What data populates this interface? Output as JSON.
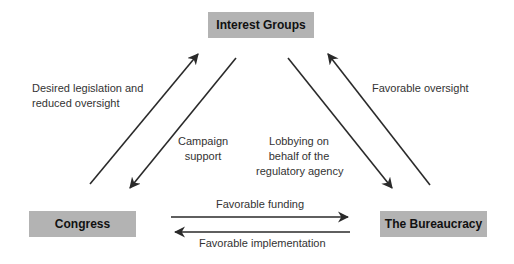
{
  "nodes": {
    "interest_groups": "Interest Groups",
    "congress": "Congress",
    "bureaucracy": "The Bureaucracy"
  },
  "edges": {
    "desired_legislation": [
      "Desired legislation and",
      "reduced oversight"
    ],
    "campaign_support": [
      "Campaign",
      "support"
    ],
    "lobbying": [
      "Lobbying on",
      "behalf of the",
      "regulatory agency"
    ],
    "favorable_oversight": "Favorable oversight",
    "favorable_funding": "Favorable funding",
    "favorable_implementation": "Favorable implementation"
  },
  "colors": {
    "node_fill": "#b3b3b3",
    "arrow": "#2a2a2a"
  }
}
